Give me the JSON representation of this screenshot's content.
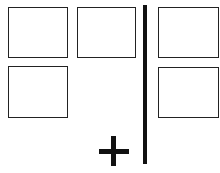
{
  "diagram": {
    "left_group": {
      "boxes": [
        {
          "id": "box-1",
          "label": ""
        },
        {
          "id": "box-2",
          "label": ""
        },
        {
          "id": "box-4",
          "label": ""
        }
      ]
    },
    "right_group": {
      "boxes": [
        {
          "id": "box-3",
          "label": ""
        },
        {
          "id": "box-5",
          "label": ""
        }
      ]
    },
    "symbols": {
      "plus": "+",
      "divider": "vertical-line"
    },
    "colors": {
      "stroke": "#222222",
      "fill": "#ffffff",
      "symbol": "#111111"
    }
  }
}
